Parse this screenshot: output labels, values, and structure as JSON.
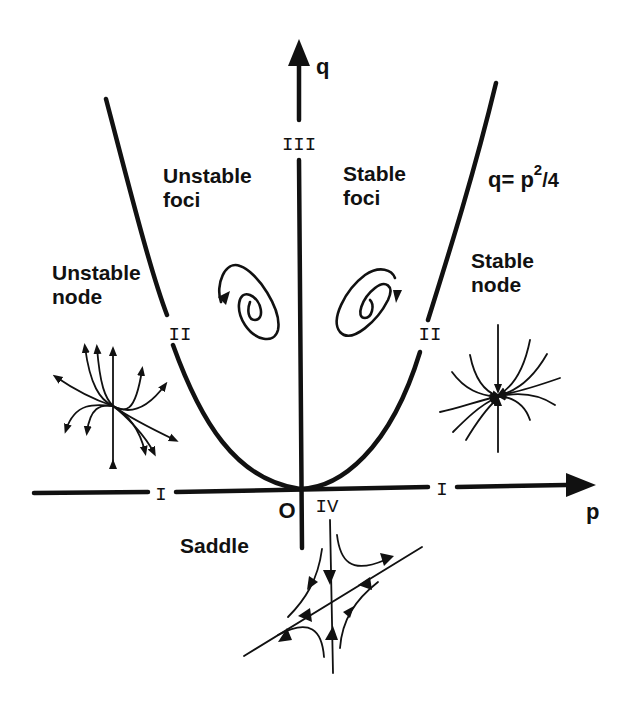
{
  "diagram": {
    "axes": {
      "x_label": "p",
      "y_label": "q",
      "origin_label": "O"
    },
    "curve": {
      "equation_prefix": "q= p",
      "equation_sup": "2",
      "equation_suffix": "/4"
    },
    "regions": [
      {
        "id": "unstable-node",
        "line1": "Unstable",
        "line2": "node",
        "roman": "II"
      },
      {
        "id": "unstable-foci",
        "line1": "Unstable",
        "line2": "foci",
        "roman": "III"
      },
      {
        "id": "stable-foci",
        "line1": "Stable",
        "line2": "foci",
        "roman": "III"
      },
      {
        "id": "stable-node",
        "line1": "Stable",
        "line2": "node",
        "roman": "II"
      },
      {
        "id": "saddle",
        "line1": "Saddle",
        "roman": "IV"
      }
    ],
    "roman_labels": {
      "top": "III",
      "left_curve": "II",
      "right_curve": "II",
      "left_axis": "I",
      "right_axis": "I",
      "below_origin": "IV"
    },
    "colors": {
      "ink": "#111111",
      "background": "#ffffff"
    }
  }
}
